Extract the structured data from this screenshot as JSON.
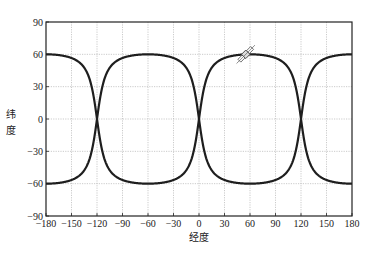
{
  "chart_data": {
    "type": "line",
    "title": "",
    "xlabel": "经度",
    "ylabel": "纬度",
    "xlim": [
      -180,
      180
    ],
    "ylim": [
      -90,
      90
    ],
    "xticks": [
      -180,
      -150,
      -120,
      -90,
      -60,
      -30,
      0,
      30,
      60,
      90,
      120,
      150,
      180
    ],
    "yticks": [
      -90,
      -60,
      -30,
      0,
      30,
      60,
      90
    ],
    "xtick_labels": [
      "−180",
      "−150",
      "−120",
      "−90",
      "−60",
      "−30",
      "0",
      "30",
      "60",
      "90",
      "120",
      "150",
      "180"
    ],
    "ytick_labels": [
      "−90",
      "−60",
      "−30",
      "0",
      "30",
      "60",
      "90"
    ],
    "grid": true,
    "legend": "none",
    "series": [
      {
        "name": "upper-track",
        "x": [
          -180,
          -165,
          -150,
          -135,
          -120,
          -105,
          -90,
          -75,
          -60,
          -45,
          -30,
          -15,
          0,
          15,
          30,
          45,
          60,
          75,
          90,
          105,
          120,
          135,
          150,
          165,
          180
        ],
        "values": [
          60,
          57,
          47,
          30,
          0,
          47,
          57,
          60,
          60,
          57,
          47,
          30,
          0,
          47,
          57,
          60,
          60,
          57,
          47,
          30,
          0,
          47,
          57,
          60,
          60
        ]
      },
      {
        "name": "lower-track",
        "x": [
          -180,
          -165,
          -150,
          -135,
          -120,
          -105,
          -90,
          -75,
          -60,
          -45,
          -30,
          -15,
          0,
          15,
          30,
          45,
          60,
          75,
          90,
          105,
          120,
          135,
          150,
          165,
          180
        ],
        "values": [
          -60,
          -57,
          -47,
          -30,
          0,
          -47,
          -57,
          -60,
          -60,
          -57,
          -47,
          -30,
          0,
          -47,
          -57,
          -60,
          -60,
          -57,
          -47,
          -30,
          0,
          -47,
          -57,
          -60,
          -60
        ]
      }
    ],
    "shape": {
      "max_latitude": 60,
      "zero_crossings": [
        -120,
        0,
        120
      ],
      "steepness": 5
    },
    "annotations": [
      {
        "type": "icon",
        "name": "satellite",
        "x": 55,
        "y": 60
      }
    ]
  }
}
